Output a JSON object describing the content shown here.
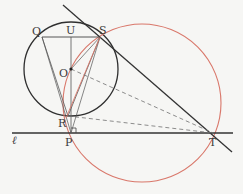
{
  "diagram": {
    "colors": {
      "background": "#f6f6f4",
      "black_circle": "#2f2f2f",
      "red_circle": "#d9776a",
      "red_chord": "#d9776a",
      "line": "#333333",
      "dashed": "#707070",
      "thin": "#555555"
    },
    "points": {
      "Q": {
        "label": "Q",
        "x": 42,
        "y": 37
      },
      "U": {
        "label": "U",
        "x": 71,
        "y": 37
      },
      "S": {
        "label": "S",
        "x": 100,
        "y": 37
      },
      "O": {
        "label": "O",
        "x": 71,
        "y": 69
      },
      "R": {
        "label": "R",
        "x": 68,
        "y": 116
      },
      "P": {
        "label": "P",
        "x": 71,
        "y": 133
      },
      "T": {
        "label": "T",
        "x": 213,
        "y": 133
      }
    },
    "labels": {
      "Q": "Q",
      "U": "U",
      "S": "S",
      "O": "O",
      "R": "R",
      "P": "P",
      "T": "T",
      "line_l": "ℓ"
    },
    "circles": [
      {
        "name": "circle-O",
        "cx": 71,
        "cy": 69,
        "r": 47,
        "color": "#2f2f2f"
      },
      {
        "name": "circle-OPT",
        "cx": 142,
        "cy": 103,
        "r": 79,
        "color": "#d9776a"
      }
    ],
    "lines": {
      "line_l": {
        "x1": 12,
        "y1": 133,
        "x2": 233,
        "y2": 133
      },
      "tangent_ST": {
        "x1": 63,
        "y1": 5,
        "x2": 232,
        "y2": 152
      }
    },
    "right_angle_mark": {
      "at": "P",
      "size": 5
    }
  }
}
